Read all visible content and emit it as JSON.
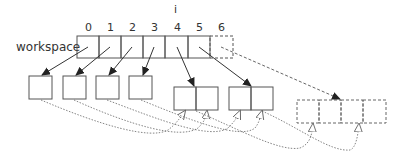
{
  "diagram": {
    "array_label": "workspace",
    "pointer_label": "i",
    "indices": [
      "0",
      "1",
      "2",
      "3",
      "4",
      "5",
      "6"
    ],
    "colors": {
      "stroke": "#555555",
      "text": "#333333",
      "background": "#ffffff"
    }
  }
}
